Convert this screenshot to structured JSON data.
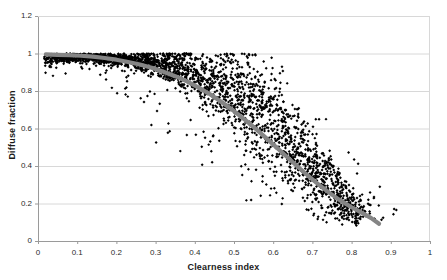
{
  "chart_data": {
    "type": "scatter",
    "title": "",
    "xlabel": "Clearness index",
    "ylabel": "Diffuse fraction",
    "xlim": [
      0,
      1
    ],
    "ylim": [
      0,
      1.2
    ],
    "xticks": [
      "0",
      "0.1",
      "0.2",
      "0.3",
      "0.4",
      "0.5",
      "0.6",
      "0.7",
      "0.8",
      "0.9",
      "1"
    ],
    "yticks": [
      "0",
      "0.2",
      "0.4",
      "0.6",
      "0.8",
      "1",
      "1.2"
    ],
    "xtick_values": [
      0,
      0.1,
      0.2,
      0.3,
      0.4,
      0.5,
      0.6,
      0.7,
      0.8,
      0.9,
      1
    ],
    "ytick_values": [
      0,
      0.2,
      0.4,
      0.6,
      0.8,
      1,
      1.2
    ],
    "grid": {
      "horizontal": true,
      "vertical": false,
      "color": "#d5d5d5"
    },
    "legend": {
      "visible": false,
      "position": "none"
    },
    "plot_area_px": {
      "left": 38,
      "top": 16,
      "right": 430,
      "bottom": 241
    },
    "colors": {
      "marker": "#000000",
      "trendline": "#858585",
      "axis": "#9a9a9a",
      "grid": "#d8d8d8",
      "background": "#ffffff",
      "text": "#2b2b2b"
    },
    "series": [
      {
        "name": "Measured data",
        "marker": "diamond",
        "marker_size_px": 2.1,
        "color": "#000000",
        "n_points": 2600,
        "description": "Dense scatter cloud of diffuse fraction versus clearness index; saturates near 1.0 below kt=0.2, falls steeply between kt=0.35 and kt=0.75, converging toward 0.08-0.15 above kt=0.78."
      },
      {
        "name": "Fitted curve",
        "type": "line",
        "color": "#858585",
        "line_width_px": 4.2,
        "x_start": 0.02,
        "x_end": 0.87,
        "y_start": 1.0,
        "y_end": 0.09,
        "points": [
          [
            0.02,
            0.995
          ],
          [
            0.05,
            0.993
          ],
          [
            0.08,
            0.991
          ],
          [
            0.11,
            0.988
          ],
          [
            0.14,
            0.983
          ],
          [
            0.17,
            0.976
          ],
          [
            0.2,
            0.967
          ],
          [
            0.23,
            0.955
          ],
          [
            0.26,
            0.941
          ],
          [
            0.29,
            0.924
          ],
          [
            0.32,
            0.903
          ],
          [
            0.35,
            0.879
          ],
          [
            0.38,
            0.851
          ],
          [
            0.41,
            0.818
          ],
          [
            0.44,
            0.781
          ],
          [
            0.47,
            0.739
          ],
          [
            0.5,
            0.693
          ],
          [
            0.53,
            0.643
          ],
          [
            0.56,
            0.59
          ],
          [
            0.59,
            0.534
          ],
          [
            0.62,
            0.477
          ],
          [
            0.65,
            0.42
          ],
          [
            0.68,
            0.364
          ],
          [
            0.71,
            0.311
          ],
          [
            0.74,
            0.262
          ],
          [
            0.77,
            0.218
          ],
          [
            0.8,
            0.18
          ],
          [
            0.83,
            0.146
          ],
          [
            0.85,
            0.122
          ],
          [
            0.87,
            0.092
          ]
        ]
      }
    ],
    "scatter_envelope": [
      {
        "kt": 0.02,
        "low": 0.88,
        "high": 1.0,
        "core_low": 0.95,
        "core_high": 1.0,
        "density": 0.55
      },
      {
        "kt": 0.06,
        "low": 0.88,
        "high": 1.0,
        "core_low": 0.95,
        "core_high": 1.0,
        "density": 0.8
      },
      {
        "kt": 0.1,
        "low": 0.92,
        "high": 1.0,
        "core_low": 0.96,
        "core_high": 1.0,
        "density": 0.95
      },
      {
        "kt": 0.15,
        "low": 0.9,
        "high": 1.0,
        "core_low": 0.96,
        "core_high": 1.0,
        "density": 1.0
      },
      {
        "kt": 0.2,
        "low": 0.79,
        "high": 1.0,
        "core_low": 0.94,
        "core_high": 1.0,
        "density": 1.0
      },
      {
        "kt": 0.25,
        "low": 0.72,
        "high": 1.0,
        "core_low": 0.92,
        "core_high": 1.0,
        "density": 1.0
      },
      {
        "kt": 0.3,
        "low": 0.52,
        "high": 1.0,
        "core_low": 0.88,
        "core_high": 1.0,
        "density": 1.0
      },
      {
        "kt": 0.35,
        "low": 0.42,
        "high": 1.0,
        "core_low": 0.84,
        "core_high": 1.0,
        "density": 1.0
      },
      {
        "kt": 0.4,
        "low": 0.4,
        "high": 1.0,
        "core_low": 0.78,
        "core_high": 1.0,
        "density": 1.0
      },
      {
        "kt": 0.45,
        "low": 0.34,
        "high": 1.0,
        "core_low": 0.7,
        "core_high": 1.0,
        "density": 1.0
      },
      {
        "kt": 0.5,
        "low": 0.19,
        "high": 1.0,
        "core_low": 0.6,
        "core_high": 0.98,
        "density": 1.0
      },
      {
        "kt": 0.55,
        "low": 0.22,
        "high": 1.0,
        "core_low": 0.48,
        "core_high": 0.94,
        "density": 1.0
      },
      {
        "kt": 0.6,
        "low": 0.18,
        "high": 1.0,
        "core_low": 0.38,
        "core_high": 0.86,
        "density": 0.95
      },
      {
        "kt": 0.65,
        "low": 0.14,
        "high": 0.86,
        "core_low": 0.3,
        "core_high": 0.7,
        "density": 0.9
      },
      {
        "kt": 0.7,
        "low": 0.11,
        "high": 0.74,
        "core_low": 0.22,
        "core_high": 0.55,
        "density": 0.9
      },
      {
        "kt": 0.75,
        "low": 0.08,
        "high": 0.62,
        "core_low": 0.15,
        "core_high": 0.42,
        "density": 0.85
      },
      {
        "kt": 0.78,
        "low": 0.07,
        "high": 0.52,
        "core_low": 0.12,
        "core_high": 0.32,
        "density": 0.8
      },
      {
        "kt": 0.81,
        "low": 0.07,
        "high": 0.47,
        "core_low": 0.1,
        "core_high": 0.24,
        "density": 0.55
      },
      {
        "kt": 0.84,
        "low": 0.08,
        "high": 0.44,
        "core_low": 0.1,
        "core_high": 0.22,
        "density": 0.14
      },
      {
        "kt": 0.87,
        "low": 0.1,
        "high": 0.38,
        "core_low": 0.12,
        "core_high": 0.3,
        "density": 0.06
      },
      {
        "kt": 0.9,
        "low": 0.08,
        "high": 0.31,
        "core_low": 0.1,
        "core_high": 0.26,
        "density": 0.04
      }
    ]
  }
}
